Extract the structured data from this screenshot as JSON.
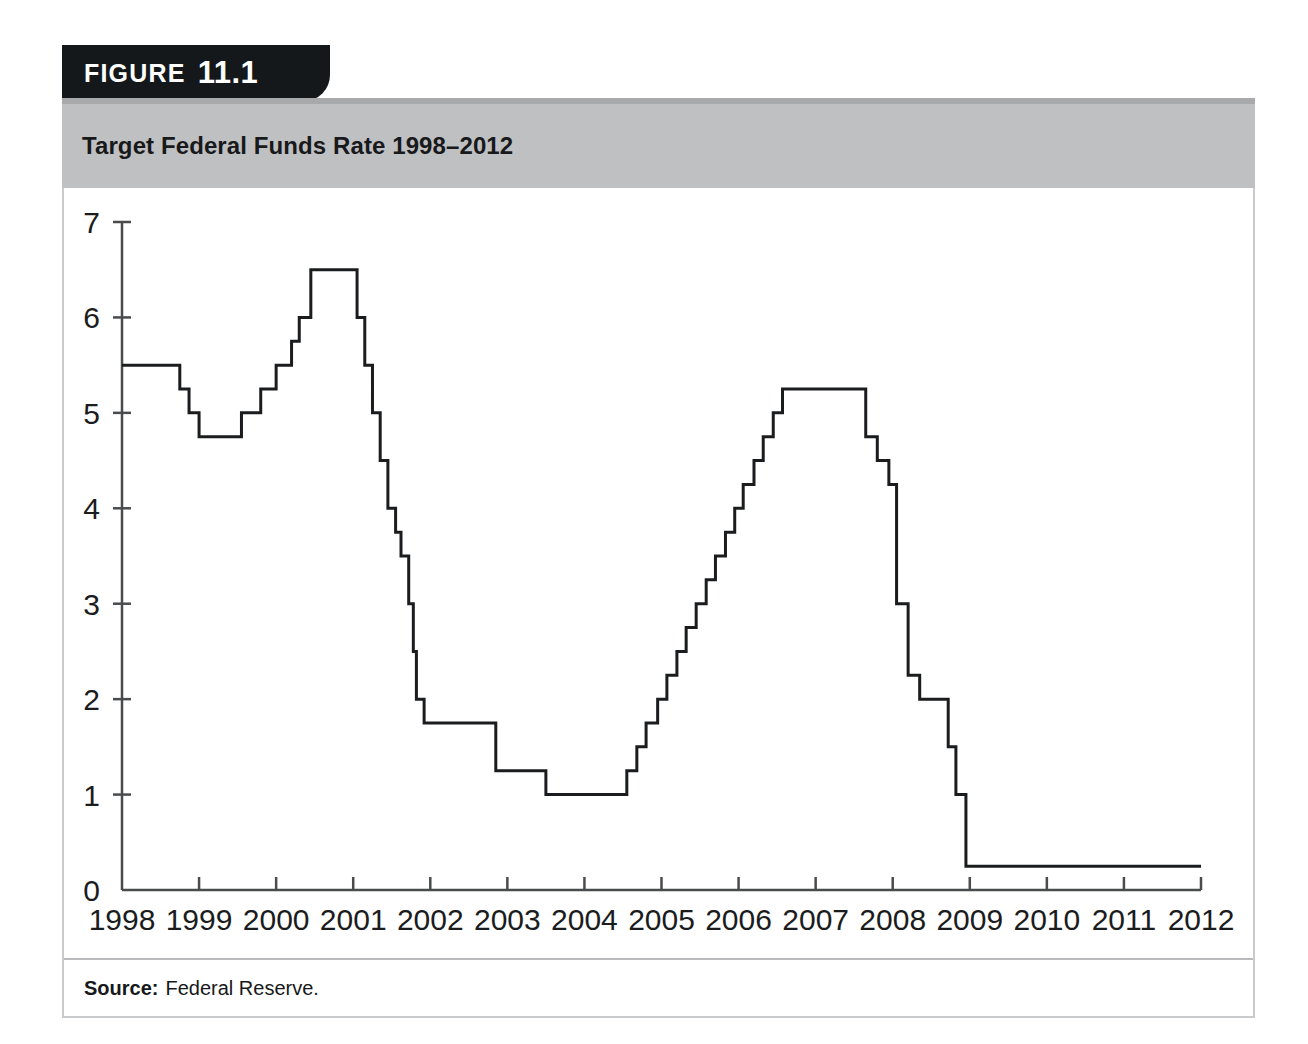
{
  "figure": {
    "tab_word": "FIGURE",
    "tab_number": "11.1",
    "title": "Target Federal Funds Rate 1998–2012",
    "source_label": "Source:",
    "source_text": "Federal Reserve."
  },
  "colors": {
    "tab_background": "#15181a",
    "title_band": "#bfc0c2",
    "title_band_top": "#a8a9ab",
    "line": "#1b1c1e",
    "axis": "#4a4b4d",
    "card_border": "#c9cacc",
    "page_background": "#ffffff"
  },
  "chart_data": {
    "type": "line",
    "title": "Target Federal Funds Rate 1998–2012",
    "subtitle": "",
    "xlabel": "",
    "ylabel": "",
    "grid": false,
    "legend": "none",
    "line_style": "step-post",
    "xlim": [
      1998,
      2012
    ],
    "ylim": [
      0,
      7
    ],
    "ytick_labels": [
      "0",
      "1",
      "2",
      "3",
      "4",
      "5",
      "6",
      "7"
    ],
    "yticks": [
      0,
      1,
      2,
      3,
      4,
      5,
      6,
      7
    ],
    "xtick_labels": [
      "1998",
      "1999",
      "2000",
      "2001",
      "2002",
      "2003",
      "2004",
      "2005",
      "2006",
      "2007",
      "2008",
      "2009",
      "2010",
      "2011",
      "2012"
    ],
    "xticks": [
      1998,
      1999,
      2000,
      2001,
      2002,
      2003,
      2004,
      2005,
      2006,
      2007,
      2008,
      2009,
      2010,
      2011,
      2012
    ],
    "units": "percent",
    "series": [
      {
        "name": "Target federal funds rate",
        "points": [
          [
            1998.0,
            5.5
          ],
          [
            1998.75,
            5.25
          ],
          [
            1998.87,
            5.0
          ],
          [
            1999.0,
            4.75
          ],
          [
            1999.5,
            4.75
          ],
          [
            1999.55,
            5.0
          ],
          [
            1999.8,
            5.25
          ],
          [
            2000.0,
            5.5
          ],
          [
            2000.2,
            5.75
          ],
          [
            2000.3,
            6.0
          ],
          [
            2000.45,
            6.5
          ],
          [
            2001.0,
            6.5
          ],
          [
            2001.05,
            6.0
          ],
          [
            2001.15,
            5.5
          ],
          [
            2001.25,
            5.0
          ],
          [
            2001.35,
            4.5
          ],
          [
            2001.45,
            4.0
          ],
          [
            2001.55,
            3.75
          ],
          [
            2001.62,
            3.5
          ],
          [
            2001.72,
            3.0
          ],
          [
            2001.78,
            2.5
          ],
          [
            2001.82,
            2.0
          ],
          [
            2001.92,
            1.75
          ],
          [
            2002.85,
            1.25
          ],
          [
            2003.5,
            1.0
          ],
          [
            2004.5,
            1.0
          ],
          [
            2004.55,
            1.25
          ],
          [
            2004.68,
            1.5
          ],
          [
            2004.8,
            1.75
          ],
          [
            2004.95,
            2.0
          ],
          [
            2005.07,
            2.25
          ],
          [
            2005.2,
            2.5
          ],
          [
            2005.32,
            2.75
          ],
          [
            2005.45,
            3.0
          ],
          [
            2005.58,
            3.25
          ],
          [
            2005.7,
            3.5
          ],
          [
            2005.83,
            3.75
          ],
          [
            2005.95,
            4.0
          ],
          [
            2006.06,
            4.25
          ],
          [
            2006.2,
            4.5
          ],
          [
            2006.32,
            4.75
          ],
          [
            2006.45,
            5.0
          ],
          [
            2006.57,
            5.25
          ],
          [
            2007.6,
            5.25
          ],
          [
            2007.65,
            4.75
          ],
          [
            2007.8,
            4.5
          ],
          [
            2007.95,
            4.25
          ],
          [
            2008.05,
            3.0
          ],
          [
            2008.2,
            2.25
          ],
          [
            2008.35,
            2.0
          ],
          [
            2008.72,
            1.5
          ],
          [
            2008.82,
            1.0
          ],
          [
            2008.95,
            0.25
          ],
          [
            2012.0,
            0.25
          ]
        ]
      }
    ],
    "key_levels": {
      "start_1998": 5.5,
      "trough_1999": 4.75,
      "peak_2000_2001": 6.5,
      "trough_2003_2004": 1.0,
      "peak_2006_2007": 5.25,
      "floor_2009_2012": 0.25
    }
  }
}
